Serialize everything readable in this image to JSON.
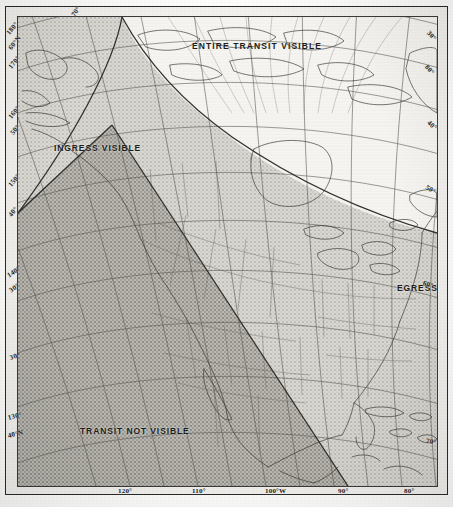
{
  "figure": {
    "kind": "transit-visibility-map",
    "projection_note": "conic graticule over North America"
  },
  "zones": [
    {
      "id": "entire",
      "label": "ENTIRE TRANSIT VISIBLE",
      "shade": "#f4f3ef",
      "density": "lightest"
    },
    {
      "id": "ingress",
      "label": "INGRESS VISIBLE",
      "shade": "#d8d6d0",
      "density": "light"
    },
    {
      "id": "egress",
      "label": "EGRESS VISIBLE",
      "shade": "#d2d0ca",
      "density": "light"
    },
    {
      "id": "none",
      "label": "TRANSIT NOT VISIBLE",
      "shade": "#b7b5ae",
      "density": "dark"
    }
  ],
  "graticule": {
    "bottom_labels": [
      {
        "text": "120°",
        "x": 118,
        "y": 487
      },
      {
        "text": "110°",
        "x": 192,
        "y": 487
      },
      {
        "text": "100°W",
        "x": 265,
        "y": 487
      },
      {
        "text": "90°",
        "x": 338,
        "y": 487
      },
      {
        "text": "80°",
        "x": 404,
        "y": 487
      }
    ],
    "left_labels": [
      {
        "text": "180°",
        "x": 8,
        "y": 30,
        "rot": -52
      },
      {
        "text": "60°N",
        "x": 10,
        "y": 45,
        "rot": -52
      },
      {
        "text": "170°",
        "x": 10,
        "y": 64,
        "rot": -52
      },
      {
        "text": "160°",
        "x": 10,
        "y": 114,
        "rot": -52
      },
      {
        "text": "50°",
        "x": 12,
        "y": 130,
        "rot": -52
      },
      {
        "text": "150°",
        "x": 10,
        "y": 182,
        "rot": -52
      },
      {
        "text": "40°",
        "x": 10,
        "y": 212,
        "rot": -52
      },
      {
        "text": "140°",
        "x": 8,
        "y": 272,
        "rot": -34
      },
      {
        "text": "30°",
        "x": 10,
        "y": 287,
        "rot": -34
      },
      {
        "text": "30°",
        "x": 10,
        "y": 354,
        "rot": -18
      },
      {
        "text": "130°",
        "x": 8,
        "y": 414,
        "rot": -14
      },
      {
        "text": "40°N",
        "x": 8,
        "y": 432,
        "rot": -14
      }
    ],
    "right_labels": [
      {
        "text": "30°",
        "x": 428,
        "y": 28,
        "rot": 48
      },
      {
        "text": "80°",
        "x": 426,
        "y": 62,
        "rot": 48
      },
      {
        "text": "40°",
        "x": 428,
        "y": 118,
        "rot": 40
      },
      {
        "text": "50°",
        "x": 426,
        "y": 183,
        "rot": 30
      },
      {
        "text": "60°",
        "x": 423,
        "y": 279,
        "rot": 16
      },
      {
        "text": "70°",
        "x": 426,
        "y": 437,
        "rot": 8
      }
    ],
    "top_labels": [
      {
        "text": "70°",
        "x": 73,
        "y": 12,
        "rot": -56
      }
    ]
  }
}
